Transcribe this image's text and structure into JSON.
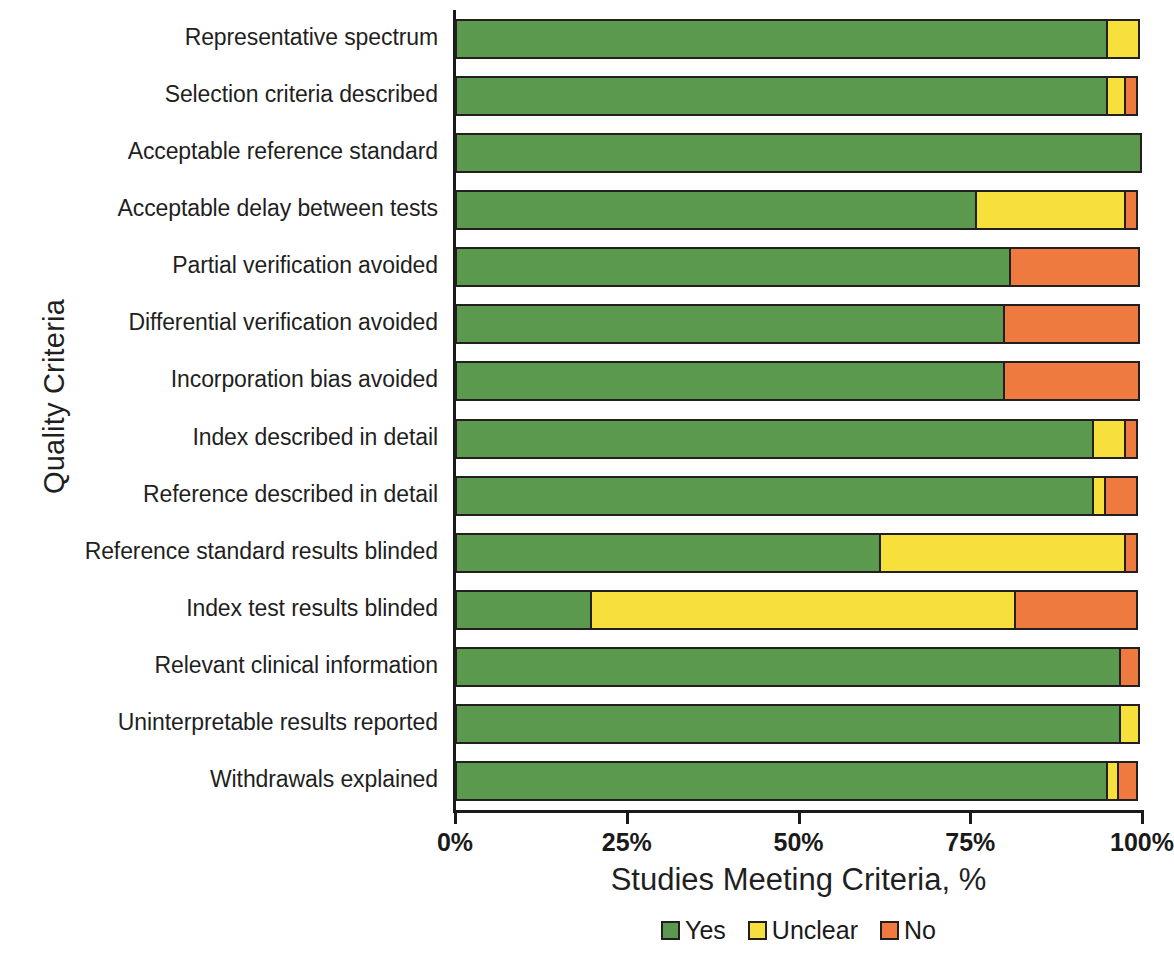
{
  "chart_data": {
    "type": "bar",
    "orientation": "horizontal",
    "stacked": true,
    "title": "",
    "xlabel": "Studies Meeting Criteria, %",
    "ylabel": "Quality Criteria",
    "xlim": [
      0,
      100
    ],
    "xticks": [
      "0%",
      "25%",
      "50%",
      "75%",
      "100%"
    ],
    "xtick_values": [
      0,
      25,
      50,
      75,
      100
    ],
    "grid": false,
    "legend_position": "bottom",
    "categories": [
      "Representative spectrum",
      "Selection criteria described",
      "Acceptable reference standard",
      "Acceptable delay between tests",
      "Partial verification avoided",
      "Differential verification avoided",
      "Incorporation bias avoided",
      "Index described in detail",
      "Reference described in detail",
      "Reference standard results blinded",
      "Index test results blinded",
      "Relevant clinical information",
      "Uninterpretable results reported",
      "Withdrawals explained"
    ],
    "series": [
      {
        "name": "Yes",
        "color": "#5b9a4e",
        "values": [
          95,
          95,
          100,
          76,
          81,
          80,
          80,
          93,
          93,
          62,
          20,
          97,
          97,
          95
        ]
      },
      {
        "name": "Unclear",
        "color": "#f7e03c",
        "values": [
          5,
          3,
          0,
          22,
          0,
          0,
          0,
          5,
          2,
          36,
          62,
          0,
          3,
          2
        ]
      },
      {
        "name": "No",
        "color": "#ef7a3f",
        "values": [
          0,
          2,
          0,
          2,
          19,
          20,
          20,
          2,
          5,
          2,
          18,
          3,
          0,
          3
        ]
      }
    ]
  },
  "legend": {
    "items": [
      {
        "label": "Yes",
        "color": "#5b9a4e"
      },
      {
        "label": "Unclear",
        "color": "#f7e03c"
      },
      {
        "label": "No",
        "color": "#ef7a3f"
      }
    ]
  }
}
